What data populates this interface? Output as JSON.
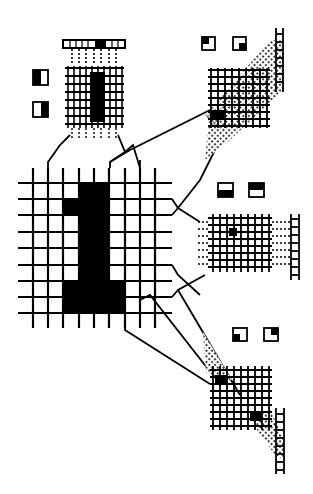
{
  "figure": {
    "input_symbol": "1",
    "colors": {
      "ink": "#000000",
      "paper": "#ffffff",
      "stipple": "#222222"
    }
  },
  "input_grid": {
    "label": "input-retina",
    "cols": 8,
    "rows": 8,
    "origin": [
      33,
      183
    ],
    "cell_w": 15.3,
    "cell_h": 16.3,
    "filled_cells": [
      [
        0,
        3
      ],
      [
        0,
        4
      ],
      [
        1,
        2
      ],
      [
        1,
        3
      ],
      [
        1,
        4
      ],
      [
        2,
        3
      ],
      [
        2,
        4
      ],
      [
        3,
        3
      ],
      [
        3,
        4
      ],
      [
        4,
        3
      ],
      [
        4,
        4
      ],
      [
        5,
        3
      ],
      [
        5,
        4
      ],
      [
        6,
        3
      ],
      [
        6,
        4
      ],
      [
        7,
        2
      ],
      [
        7,
        3
      ],
      [
        7,
        4
      ],
      [
        7,
        5
      ]
    ]
  },
  "detectors": [
    {
      "id": "vertical",
      "icons": [
        "left-half-filled",
        "right-half-filled"
      ],
      "orientation": "vertical-edge",
      "position": [
        65,
        65
      ],
      "output_strip": "top"
    },
    {
      "id": "diag-up",
      "icons": [
        "bottom-left-corner-filled",
        "bottom-right-corner-filled"
      ],
      "orientation": "diagonal-45",
      "position": [
        210,
        70
      ],
      "output_strip": "top-right-diagonal"
    },
    {
      "id": "horizontal",
      "icons": [
        "top-half-filled",
        "bottom-half-filled"
      ],
      "orientation": "horizontal-edge",
      "position": [
        210,
        215
      ],
      "output_strip": "right"
    },
    {
      "id": "diag-down",
      "icons": [
        "top-left-corner-filled",
        "top-right-corner-filled"
      ],
      "orientation": "diagonal-135",
      "position": [
        210,
        365
      ],
      "output_strip": "bottom-right-diagonal"
    }
  ]
}
